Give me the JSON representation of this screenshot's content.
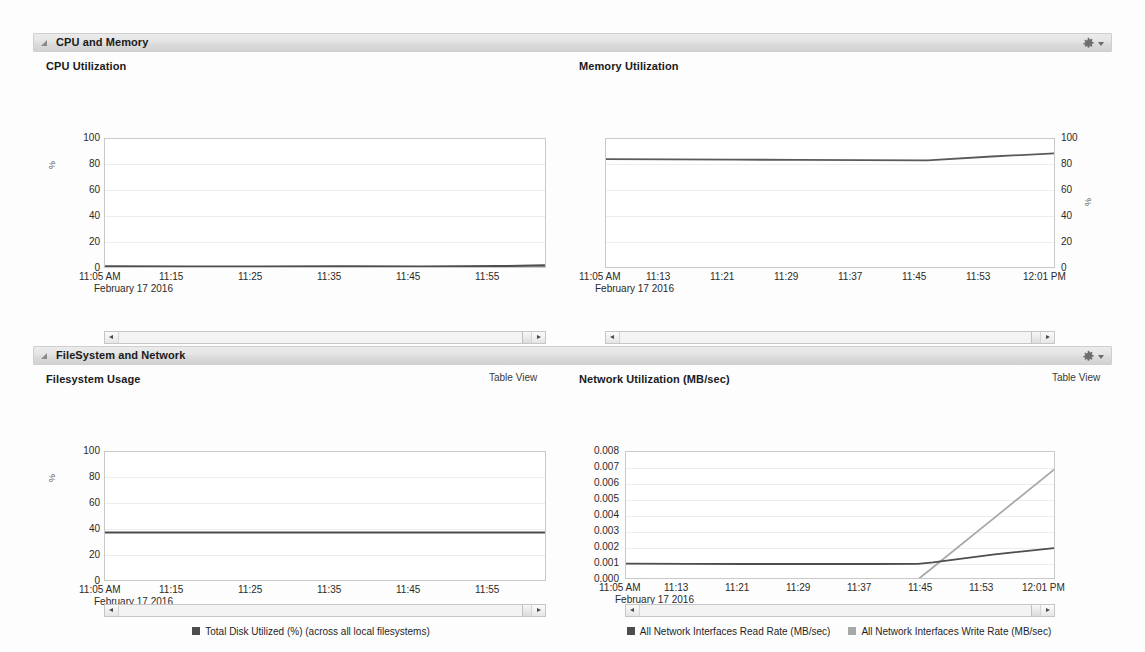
{
  "panels": [
    {
      "id": "cpu-memory",
      "title": "CPU and Memory",
      "gear_icon": "gear-icon",
      "collapse_icon": "collapse-triangle-icon"
    },
    {
      "id": "filesystem-network",
      "title": "FileSystem and Network",
      "gear_icon": "gear-icon",
      "collapse_icon": "collapse-triangle-icon"
    }
  ],
  "table_view_label": "Table View",
  "date_label": "February 17 2016",
  "charts": [
    {
      "id": "cpu-utilization",
      "title": "CPU Utilization",
      "axis_side": "left",
      "legend": [
        {
          "label": "CPU in User Mode (%)",
          "color": "#4d4d4d"
        },
        {
          "label": "CPU in System Mode (%)",
          "color": "#9a9a9a"
        },
        {
          "label": "CPU in I/O Wait (%)",
          "color": "#bdbdbd"
        }
      ]
    },
    {
      "id": "memory-utilization",
      "title": "Memory Utilization",
      "axis_side": "right",
      "legend": [
        {
          "label": "Memory Utilization (%)",
          "color": "#5a5a5a"
        }
      ]
    },
    {
      "id": "filesystem-usage",
      "title": "Filesystem Usage",
      "axis_side": "left",
      "legend": [
        {
          "label": "Total Disk Utilized (%) (across all local filesystems)",
          "color": "#4d4d4d"
        }
      ]
    },
    {
      "id": "network-utilization",
      "title": "Network Utilization (MB/sec)",
      "axis_side": "left",
      "legend": [
        {
          "label": "All Network Interfaces Read Rate (MB/sec)",
          "color": "#4d4d4d"
        },
        {
          "label": "All Network Interfaces Write Rate (MB/sec)",
          "color": "#a8a8a8"
        }
      ]
    }
  ],
  "chart_data": [
    {
      "id": "cpu-utilization",
      "type": "line",
      "title": "CPU Utilization",
      "xlabel": "February 17 2016",
      "ylabel": "%",
      "ylim": [
        0,
        100
      ],
      "yticks": [
        0,
        20,
        40,
        60,
        80,
        100
      ],
      "xticks": [
        "11:05 AM",
        "11:15",
        "11:25",
        "11:35",
        "11:45",
        "11:55"
      ],
      "x": [
        0,
        10,
        20,
        30,
        40,
        50,
        56
      ],
      "grid": true,
      "legend_position": "bottom",
      "series": [
        {
          "name": "CPU in User Mode (%)",
          "color": "#4d4d4d",
          "values": [
            2.1,
            2.0,
            2.0,
            2.1,
            2.0,
            2.2,
            3.0
          ]
        },
        {
          "name": "CPU in System Mode (%)",
          "color": "#9a9a9a",
          "values": [
            1.2,
            1.1,
            1.1,
            1.2,
            1.1,
            1.2,
            1.6
          ]
        },
        {
          "name": "CPU in I/O Wait (%)",
          "color": "#bdbdbd",
          "values": [
            0.5,
            0.4,
            0.4,
            0.5,
            0.4,
            0.5,
            0.7
          ]
        }
      ]
    },
    {
      "id": "memory-utilization",
      "type": "line",
      "title": "Memory Utilization",
      "xlabel": "February 17 2016",
      "ylabel": "%",
      "ylim": [
        0,
        100
      ],
      "yticks": [
        0,
        20,
        40,
        60,
        80,
        100
      ],
      "xticks": [
        "11:05 AM",
        "11:13",
        "11:21",
        "11:29",
        "11:37",
        "11:45",
        "11:53",
        "12:01 PM"
      ],
      "x": [
        0,
        8,
        16,
        24,
        32,
        40,
        48,
        56
      ],
      "grid": true,
      "legend_position": "bottom",
      "series": [
        {
          "name": "Memory Utilization (%)",
          "color": "#5a5a5a",
          "values": [
            84.5,
            84.3,
            84.1,
            84.0,
            83.8,
            83.6,
            86.5,
            89.0
          ]
        }
      ]
    },
    {
      "id": "filesystem-usage",
      "type": "line",
      "title": "Filesystem Usage",
      "xlabel": "February 17 2016",
      "ylabel": "%",
      "ylim": [
        0,
        100
      ],
      "yticks": [
        0,
        20,
        40,
        60,
        80,
        100
      ],
      "xticks": [
        "11:05 AM",
        "11:15",
        "11:25",
        "11:35",
        "11:45",
        "11:55"
      ],
      "x": [
        0,
        10,
        20,
        30,
        40,
        50,
        56
      ],
      "grid": true,
      "legend_position": "bottom",
      "series": [
        {
          "name": "Total Disk Utilized (%) (across all local filesystems)",
          "color": "#4d4d4d",
          "values": [
            38,
            38,
            38,
            38,
            38,
            38,
            38
          ]
        }
      ]
    },
    {
      "id": "network-utilization",
      "type": "line",
      "title": "Network Utilization (MB/sec)",
      "xlabel": "February 17 2016",
      "ylabel": "MB/sec",
      "ylim": [
        0.0,
        0.008
      ],
      "yticks": [
        "0.000",
        "0.001",
        "0.002",
        "0.003",
        "0.004",
        "0.005",
        "0.006",
        "0.007",
        "0.008"
      ],
      "xticks": [
        "11:05 AM",
        "11:13",
        "11:21",
        "11:29",
        "11:37",
        "11:45",
        "11:53",
        "12:01 PM"
      ],
      "x": [
        0,
        8,
        16,
        24,
        32,
        38,
        40,
        48,
        56
      ],
      "grid": true,
      "legend_position": "bottom",
      "series": [
        {
          "name": "All Network Interfaces Read Rate (MB/sec)",
          "color": "#4d4d4d",
          "values": [
            0.00102,
            0.00101,
            0.001,
            0.001,
            0.001,
            0.00101,
            0.0011,
            0.0016,
            0.002
          ]
        },
        {
          "name": "All Network Interfaces Write Rate (MB/sec)",
          "color": "#a8a8a8",
          "values": [
            2e-05,
            2e-05,
            2e-05,
            2e-05,
            2e-05,
            3e-05,
            0.0008,
            0.0039,
            0.007
          ]
        }
      ]
    }
  ],
  "scrollbars": [
    {
      "id": "cpu-scrollbar"
    },
    {
      "id": "memory-scrollbar"
    },
    {
      "id": "filesystem-scrollbar"
    },
    {
      "id": "network-scrollbar"
    }
  ]
}
